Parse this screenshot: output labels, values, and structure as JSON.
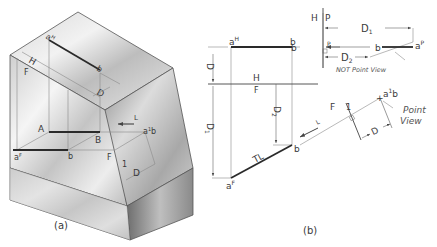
{
  "figure": {
    "panel_a": {
      "caption": "(a)",
      "labels": {
        "aH": "a",
        "aH_sup": "H",
        "b_top": "b",
        "H": "H",
        "F": "F",
        "D_top": "D",
        "A": "A",
        "B": "B",
        "aF": "a",
        "aF_sup": "F",
        "b_front": "b",
        "F_aux": "F",
        "one_aux": "1",
        "ab_point": "a",
        "ab_point_sup": "1",
        "ab_point_b": "b",
        "D_aux": "D",
        "L_arrow": "L"
      }
    },
    "panel_b": {
      "caption": "(b)",
      "labels": {
        "aH": "a",
        "aH_sup": "H",
        "bH": "b",
        "D_left": "D",
        "fold_H": "H",
        "fold_F": "F",
        "D1_left": "D",
        "D1_left_sub": "1",
        "D2_mid": "D",
        "D2_mid_sub": "2",
        "TL": "TL",
        "bF": "b",
        "aF": "a",
        "aF_sup": "F",
        "fold_HP_H": "H",
        "fold_HP_P": "P",
        "D1_top": "D",
        "D1_top_sub": "1",
        "bP_left": "b",
        "p_small": "P",
        "bP": "b",
        "aP": "a",
        "aP_sup": "P",
        "D2_top": "D",
        "D2_top_sub": "2",
        "not_point_view": "NOT Point View",
        "fold_F1_F": "F",
        "fold_F1_1": "1",
        "ab1": "a",
        "ab1_sup": "1",
        "ab1_b": "b",
        "point_view_1": "Point",
        "point_view_2": "View",
        "D_aux": "D",
        "L_arrow": "L"
      }
    }
  }
}
